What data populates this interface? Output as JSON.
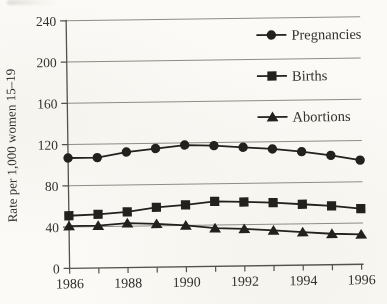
{
  "chart_data": {
    "type": "line",
    "title": "",
    "xlabel": "",
    "ylabel": "Rate per 1,000 women 15–19",
    "x": [
      1986,
      1987,
      1988,
      1989,
      1990,
      1991,
      1992,
      1993,
      1994,
      1995,
      1996
    ],
    "series": [
      {
        "name": "Pregnancies",
        "marker": "circle",
        "values": [
          107,
          107,
          112,
          115,
          118,
          117,
          115,
          113,
          110,
          106,
          101
        ]
      },
      {
        "name": "Births",
        "marker": "square",
        "values": [
          51,
          52,
          54,
          58,
          60,
          63,
          62,
          61,
          59,
          57,
          54
        ]
      },
      {
        "name": "Abortions",
        "marker": "triangle",
        "values": [
          41,
          41,
          43,
          42,
          40,
          37,
          36,
          34,
          32,
          30,
          29
        ]
      }
    ],
    "ylim": [
      0,
      240
    ],
    "yticks": [
      0,
      40,
      80,
      120,
      160,
      200,
      240
    ],
    "xticks_labeled": [
      1986,
      1988,
      1990,
      1992,
      1994,
      1996
    ],
    "grid": "horizontal",
    "legend_position": "top-right-inside",
    "colors": {
      "series": "#23211e",
      "grid": "#8f8c85",
      "axis": "#55524c",
      "text": "#26231f",
      "background": "#fbfaf6"
    }
  }
}
